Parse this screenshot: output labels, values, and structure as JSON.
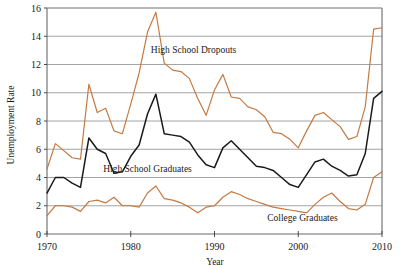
{
  "chart_data": {
    "type": "line",
    "title": "",
    "xlabel": "Year",
    "ylabel": "Unemployment Rate",
    "xlim": [
      1970,
      2010
    ],
    "ylim": [
      0,
      16
    ],
    "xticks": [
      1970,
      1980,
      1990,
      2000,
      2010
    ],
    "yticks": [
      0,
      2,
      4,
      6,
      8,
      10,
      12,
      14,
      16
    ],
    "xtick_labels": [
      "1970",
      "1980",
      "1990",
      "2000",
      "2010"
    ],
    "ytick_labels": [
      "0",
      "2",
      "4",
      "6",
      "8",
      "10",
      "12",
      "14",
      "16"
    ],
    "grid": "horizontal",
    "legend": "inline-annotations",
    "x": [
      1970,
      1971,
      1972,
      1973,
      1974,
      1975,
      1976,
      1977,
      1978,
      1979,
      1980,
      1981,
      1982,
      1983,
      1984,
      1985,
      1986,
      1987,
      1988,
      1989,
      1990,
      1991,
      1992,
      1993,
      1994,
      1995,
      1996,
      1997,
      1998,
      1999,
      2000,
      2001,
      2002,
      2003,
      2004,
      2005,
      2006,
      2007,
      2008,
      2009,
      2010
    ],
    "series": [
      {
        "name": "High School Dropouts",
        "color": "#C47A42",
        "label_x": 1987.5,
        "label_y": 12.8,
        "values": [
          4.6,
          6.4,
          5.9,
          5.4,
          5.3,
          10.6,
          8.6,
          8.9,
          7.3,
          7.1,
          9.2,
          11.4,
          14.3,
          15.7,
          12.1,
          11.6,
          11.5,
          11.0,
          9.6,
          8.4,
          10.2,
          11.3,
          9.7,
          9.6,
          9.0,
          8.8,
          8.3,
          7.2,
          7.1,
          6.7,
          6.1,
          7.3,
          8.4,
          8.6,
          8.1,
          7.6,
          6.7,
          6.9,
          9.0,
          14.5,
          14.6
        ]
      },
      {
        "name": "High School Graduates",
        "color": "#1a1a1a",
        "label_x": 1982.0,
        "label_y": 4.4,
        "values": [
          2.9,
          4.0,
          4.0,
          3.6,
          3.3,
          6.8,
          6.0,
          5.7,
          4.3,
          4.4,
          5.5,
          6.3,
          8.5,
          9.9,
          7.1,
          7.0,
          6.9,
          6.5,
          5.6,
          4.9,
          4.7,
          6.1,
          6.6,
          6.0,
          5.4,
          4.8,
          4.7,
          4.5,
          4.0,
          3.5,
          3.3,
          4.2,
          5.1,
          5.3,
          4.8,
          4.5,
          4.1,
          4.2,
          5.7,
          9.6,
          10.1
        ]
      },
      {
        "name": "College Graduates",
        "color": "#C47A42",
        "label_x": 2000.5,
        "label_y": 0.95,
        "values": [
          1.3,
          2.0,
          2.0,
          1.9,
          1.6,
          2.3,
          2.4,
          2.2,
          2.6,
          2.0,
          2.0,
          1.9,
          2.9,
          3.4,
          2.5,
          2.4,
          2.2,
          1.9,
          1.5,
          1.9,
          2.0,
          2.6,
          3.0,
          2.8,
          2.5,
          2.3,
          2.1,
          1.9,
          1.8,
          1.7,
          1.6,
          1.5,
          2.1,
          2.6,
          2.9,
          2.3,
          1.8,
          1.7,
          2.1,
          4.0,
          4.4
        ]
      }
    ]
  }
}
